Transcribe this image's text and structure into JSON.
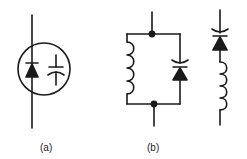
{
  "diagram": {
    "type": "circuit-schematic-symbols",
    "stroke_color": "#1a1a1a",
    "background": "#ffffff",
    "panels": [
      {
        "id": "a",
        "label": "(a)",
        "description": "Varactor diode symbol: diode with capacitor enclosed in a circle"
      },
      {
        "id": "b",
        "label": "(b)",
        "description": "Inductor in parallel with varactor diode, and inductor in series with varactor diode"
      }
    ]
  }
}
